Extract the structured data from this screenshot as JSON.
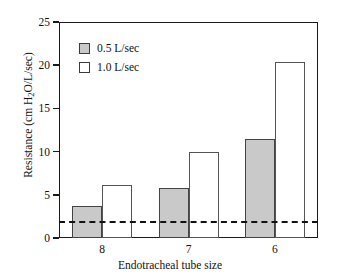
{
  "chart_data": {
    "type": "bar",
    "title": "",
    "xlabel": "Endotracheal tube size",
    "ylabel": "Resistance (cm H₂O/L/sec)",
    "ylabel_parts": {
      "prefix": "Resistance (cm H",
      "sub": "2",
      "suffix": "O/L/sec)"
    },
    "categories": [
      "8",
      "7",
      "6"
    ],
    "series": [
      {
        "name": "0.5 L/sec",
        "fill": "gray",
        "color": "#c9c9c9",
        "values": [
          3.7,
          5.8,
          11.5
        ]
      },
      {
        "name": "1.0 L/sec",
        "fill": "white",
        "color": "#ffffff",
        "values": [
          6.1,
          9.9,
          20.4
        ]
      }
    ],
    "ylim": [
      0,
      25
    ],
    "yticks": [
      0,
      5,
      10,
      15,
      20,
      25
    ],
    "ytick_labels": [
      "0",
      "5",
      "10",
      "15",
      "20",
      "25"
    ],
    "grid": false,
    "legend_position": "upper-left-inside",
    "reference_line": {
      "value": 2.0,
      "style": "dashed",
      "color": "#111111"
    }
  },
  "legend": {
    "items": [
      {
        "label": "0.5 L/sec",
        "style": "filled"
      },
      {
        "label": "1.0 L/sec",
        "style": "hollow"
      }
    ]
  },
  "axes": {
    "x_title": "Endotracheal tube size",
    "y_title_prefix": "Resistance (cm H",
    "y_title_sub": "2",
    "y_title_suffix": "O/L/sec)"
  }
}
